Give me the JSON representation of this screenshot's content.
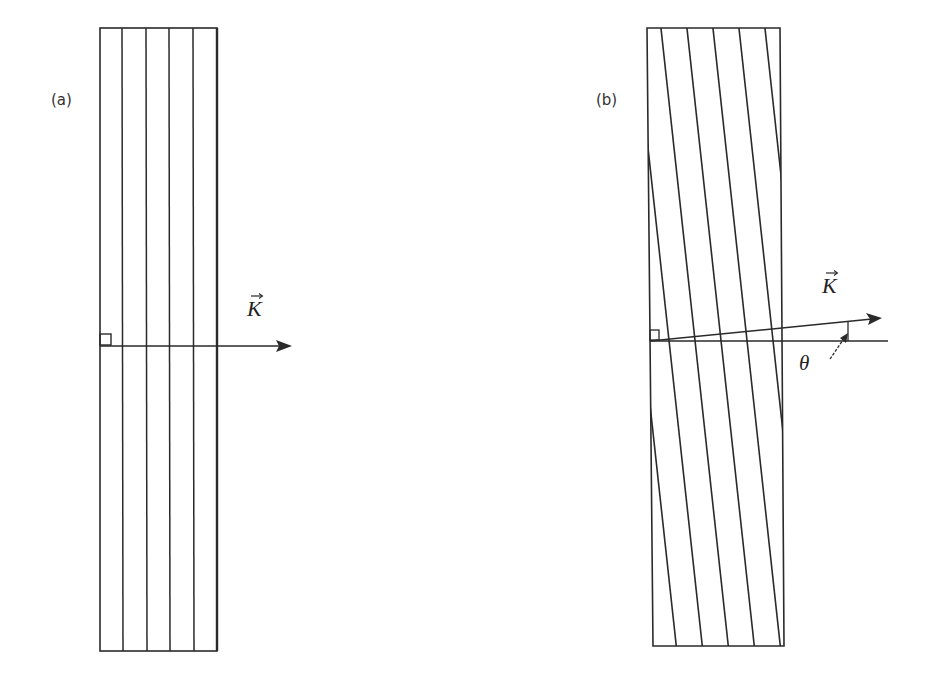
{
  "figure": {
    "panels": [
      {
        "id": "a",
        "label": "(a)",
        "description": "Rectangular slab with vertical fringes; grating vector K perpendicular to fringes",
        "vector_label": "K",
        "right_angle_marker": true
      },
      {
        "id": "b",
        "label": "(b)",
        "description": "Rectangular slab with slanted fringes; grating vector K tilted by angle theta from the horizontal",
        "vector_label": "K",
        "angle_label": "θ",
        "right_angle_marker": true
      }
    ],
    "colors": {
      "line": "#2a2a2a",
      "text": "#333333",
      "background": "#ffffff"
    }
  }
}
